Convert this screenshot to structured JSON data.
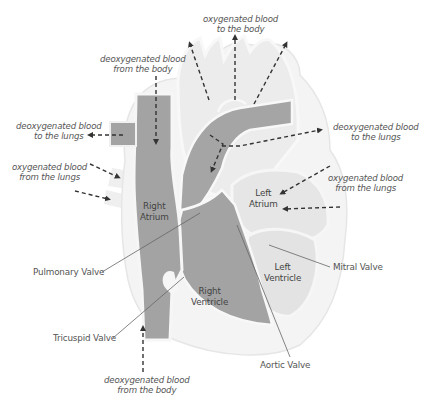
{
  "diagram": {
    "colors": {
      "background": "#ffffff",
      "deoxygenated_chambers": "#a3a3a3",
      "oxygenated_chambers": "#e8e8e8",
      "heart_outline": "#f3f3f3",
      "arrows": "#333333",
      "label_text": "#555555",
      "leader_lines": "#555555"
    },
    "flow_labels": {
      "oxy_to_body": {
        "line1": "oxygenated blood",
        "line2": "to the body"
      },
      "deoxy_from_body_top": {
        "line1": "deoxygenated blood",
        "line2": "from the body"
      },
      "deoxy_to_lungs_left": {
        "line1": "deoxygenated blood",
        "line2": "to the lungs"
      },
      "deoxy_to_lungs_right": {
        "line1": "deoxygenated blood",
        "line2": "to the lungs"
      },
      "oxy_from_lungs_left": {
        "line1": "oxygenated blood",
        "line2": "from the lungs"
      },
      "oxy_from_lungs_right": {
        "line1": "oxygenated blood",
        "line2": "from the lungs"
      },
      "deoxy_from_body_bottom": {
        "line1": "deoxygenated blood",
        "line2": "from the body"
      }
    },
    "chambers": {
      "right_atrium": {
        "line1": "Right",
        "line2": "Atrium"
      },
      "left_atrium": {
        "line1": "Left",
        "line2": "Atrium"
      },
      "right_ventricle": {
        "line1": "Right",
        "line2": "Ventricle"
      },
      "left_ventricle": {
        "line1": "Left",
        "line2": "Ventricle"
      }
    },
    "valves": {
      "pulmonary": "Pulmonary Valve",
      "tricuspid": "Tricuspid Valve",
      "mitral": "Mitral Valve",
      "aortic": "Aortic Valve"
    }
  }
}
